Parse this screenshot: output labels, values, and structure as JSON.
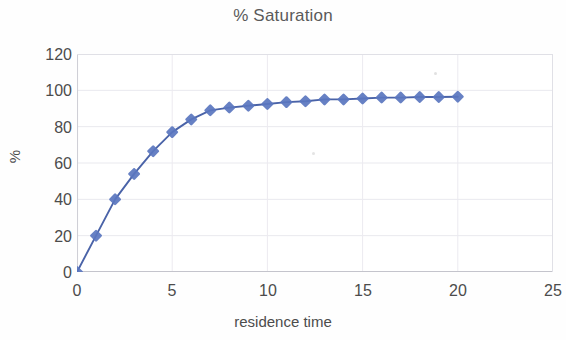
{
  "chart_data": {
    "type": "line",
    "title": "% Saturation",
    "xlabel": "residence time",
    "ylabel": "%",
    "xlim": [
      0,
      25
    ],
    "ylim": [
      0,
      120
    ],
    "grid": true,
    "legend": "none",
    "marker": "diamond",
    "series_color": "#5b77c0",
    "line_color": "#4a63a8",
    "x_ticks": [
      "0",
      "5",
      "10",
      "15",
      "20",
      "25"
    ],
    "x_tick_values": [
      0,
      5,
      10,
      15,
      20,
      25
    ],
    "y_ticks": [
      "0",
      "20",
      "40",
      "60",
      "80",
      "100",
      "120"
    ],
    "y_tick_values": [
      0,
      20,
      40,
      60,
      80,
      100,
      120
    ],
    "series": [
      {
        "name": "% Saturation",
        "x": [
          0,
          1,
          2,
          3,
          4,
          5,
          6,
          7,
          8,
          9,
          10,
          11,
          12,
          13,
          14,
          15,
          16,
          17,
          18,
          19,
          20
        ],
        "values": [
          0,
          20,
          40,
          54,
          66.5,
          77,
          84,
          89,
          90.5,
          91.5,
          92.5,
          93.5,
          94,
          95,
          95,
          95.5,
          96,
          96,
          96.3,
          96.3,
          96.5
        ]
      }
    ]
  }
}
